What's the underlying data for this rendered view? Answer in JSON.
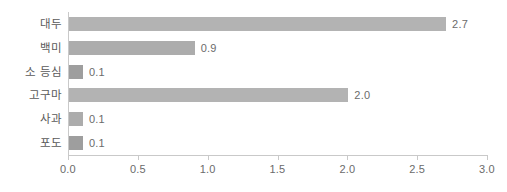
{
  "chart_data": {
    "type": "bar",
    "orientation": "horizontal",
    "title": "",
    "xlabel": "",
    "ylabel": "",
    "categories": [
      "대두",
      "백미",
      "소 등심",
      "고구마",
      "사과",
      "포도"
    ],
    "values": [
      2.7,
      0.9,
      0.1,
      2.0,
      0.1,
      0.1
    ],
    "value_labels": [
      "2.7",
      "0.9",
      "0.1",
      "2.0",
      "0.1",
      "0.1"
    ],
    "xlim": [
      0.0,
      3.0
    ],
    "xticks": [
      0.0,
      0.5,
      1.0,
      1.5,
      2.0,
      2.5,
      3.0
    ],
    "xtick_labels": [
      "0.0",
      "0.5",
      "1.0",
      "1.5",
      "2.0",
      "2.5",
      "3.0"
    ],
    "grid": false,
    "legend": null,
    "bar_color": "#b3b3b3",
    "axis_color": "#c9c9c9",
    "text_color": "#6b6b6b"
  }
}
